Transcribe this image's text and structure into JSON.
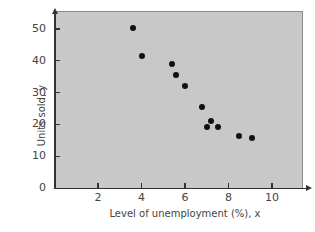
{
  "chart_data": {
    "type": "scatter",
    "title": "",
    "xlabel": "Level of unemployment (%), x",
    "ylabel": "Units sold, y",
    "xlim": [
      0,
      11
    ],
    "ylim": [
      0,
      55
    ],
    "xticks": [
      2,
      4,
      6,
      8,
      10
    ],
    "yticks": [
      0,
      10,
      20,
      30,
      40,
      50
    ],
    "grid": false,
    "legend": null,
    "background": "#c8c8c8",
    "marker_color": "#111111",
    "points": [
      {
        "x": 3.6,
        "y": 50.3
      },
      {
        "x": 4.0,
        "y": 41.5
      },
      {
        "x": 5.4,
        "y": 39.0
      },
      {
        "x": 5.6,
        "y": 35.5
      },
      {
        "x": 6.0,
        "y": 32.1
      },
      {
        "x": 6.8,
        "y": 25.5
      },
      {
        "x": 7.2,
        "y": 21.1
      },
      {
        "x": 7.0,
        "y": 19.2
      },
      {
        "x": 7.5,
        "y": 19.2
      },
      {
        "x": 8.5,
        "y": 16.4
      },
      {
        "x": 9.1,
        "y": 15.7
      }
    ]
  },
  "labels": {
    "x_axis": "Level of unemployment (%), x",
    "y_axis": "Units sold, y",
    "yticks": [
      "0",
      "10",
      "20",
      "30",
      "40",
      "50"
    ],
    "xticks": [
      "2",
      "4",
      "6",
      "8",
      "10"
    ]
  }
}
